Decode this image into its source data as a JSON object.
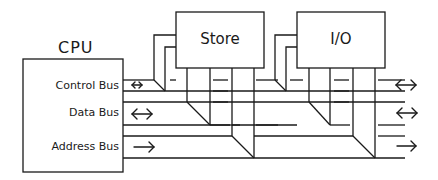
{
  "cpu": {
    "title": "CPU"
  },
  "buses": [
    {
      "label": "Control Bus",
      "arrow": "bidirectional"
    },
    {
      "label": "Data Bus",
      "arrow": "bidirectional"
    },
    {
      "label": "Address Bus",
      "arrow": "right"
    }
  ],
  "modules": [
    {
      "label": "Store"
    },
    {
      "label": "I/O"
    }
  ],
  "colors": {
    "line": "#1a1a1a",
    "background": "#ffffff"
  }
}
